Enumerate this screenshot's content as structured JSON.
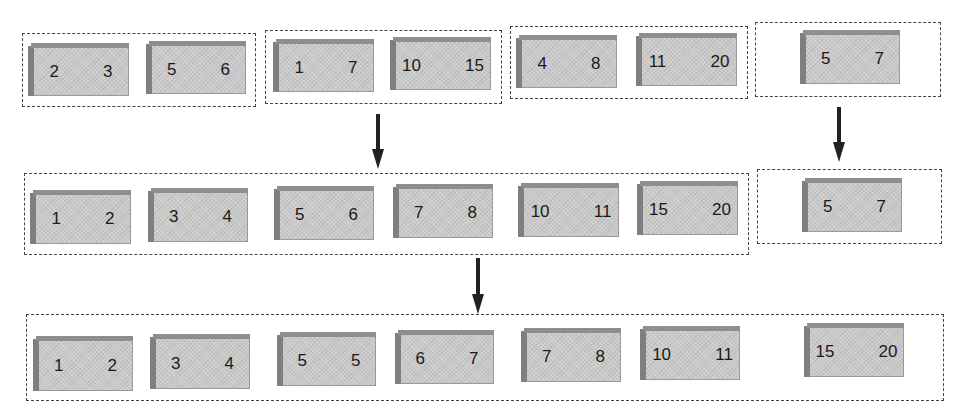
{
  "diagram": {
    "rows": [
      {
        "groups": [
          {
            "blocks": [
              {
                "label": "2   3"
              },
              {
                "label": "5   6"
              }
            ]
          },
          {
            "blocks": [
              {
                "label": "1   7"
              },
              {
                "label": "10   15"
              }
            ]
          },
          {
            "blocks": [
              {
                "label": "4   8"
              },
              {
                "label": "11   20"
              }
            ]
          },
          {
            "blocks": [
              {
                "label": "5   7"
              }
            ]
          }
        ]
      },
      {
        "groups": [
          {
            "blocks": [
              {
                "label": "1   2"
              },
              {
                "label": "3   4"
              },
              {
                "label": "5   6"
              },
              {
                "label": "7   8"
              },
              {
                "label": "10   11"
              },
              {
                "label": "15   20"
              }
            ]
          },
          {
            "blocks": [
              {
                "label": "5   7"
              }
            ]
          }
        ]
      },
      {
        "groups": [
          {
            "blocks": [
              {
                "label": "1   2"
              },
              {
                "label": "3   4"
              },
              {
                "label": "5   5"
              },
              {
                "label": "6   7"
              },
              {
                "label": "7   8"
              },
              {
                "label": "10   11"
              },
              {
                "label": "15   20"
              }
            ]
          }
        ]
      }
    ],
    "arrows": [
      {
        "from": "row1-groups-1-3",
        "to": "row2-group-1",
        "icon": "down-arrow-icon"
      },
      {
        "from": "row1-group-4",
        "to": "row2-group-2",
        "icon": "down-arrow-icon"
      },
      {
        "from": "row2",
        "to": "row3-group-1",
        "icon": "down-arrow-icon"
      }
    ]
  }
}
